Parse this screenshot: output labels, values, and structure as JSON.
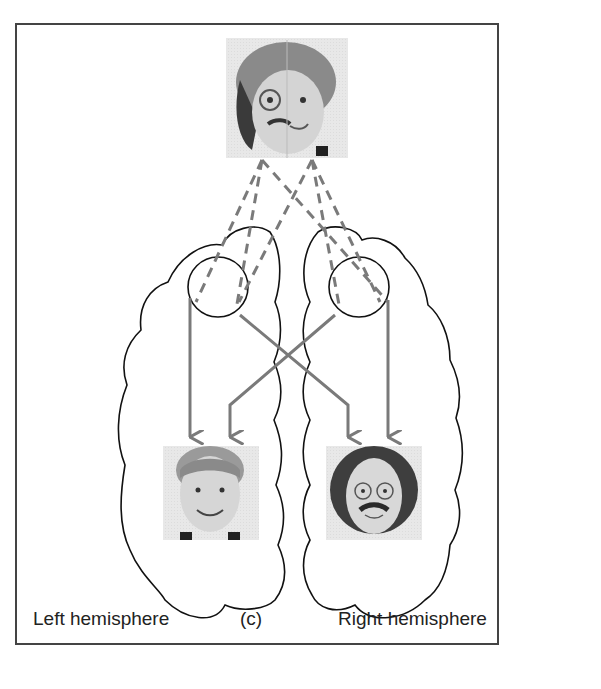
{
  "figure": {
    "panel_label": "(c)",
    "left_label": "Left hemisphere",
    "right_label": "Right hemisphere",
    "colors": {
      "frame": "#444444",
      "outline": "#111111",
      "arrow": "#7a7a7a",
      "photo_bg": "#e6e6e6"
    },
    "images": {
      "top": "chimeric face (left half man with glasses and mustache, right half boy)",
      "bottom_left": "boy face",
      "bottom_right": "man face with glasses and mustache"
    }
  }
}
